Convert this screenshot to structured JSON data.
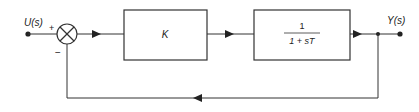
{
  "diagram": {
    "type": "feedback-control-block-diagram",
    "input_label": "U(s)",
    "output_label": "Y(s)",
    "summing_junction": {
      "plus_sign": "+",
      "minus_sign": "−"
    },
    "blocks": [
      {
        "id": "controller",
        "label": "K"
      },
      {
        "id": "plant",
        "numerator": "1",
        "denominator": "1 + sT"
      }
    ],
    "feedback": "unity negative feedback",
    "colors": {
      "line": "#333333",
      "background": "#ffffff"
    }
  }
}
